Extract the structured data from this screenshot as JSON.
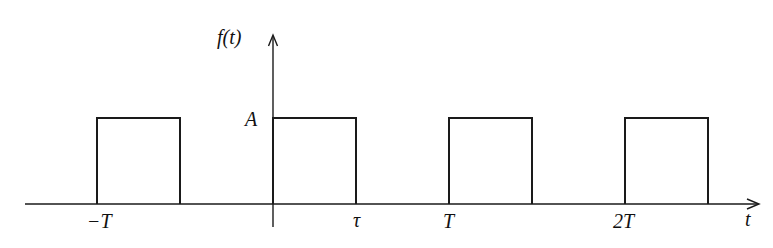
{
  "diagram": {
    "type": "periodic rectangular pulse train",
    "y_axis_label": "f(t)",
    "x_axis_label": "t",
    "amplitude_label": "A",
    "tick_labels": [
      "-T",
      "τ",
      "T",
      "2T"
    ],
    "tick_label_text": {
      "minus_T": "−T",
      "tau": "τ",
      "T": "T",
      "two_T": "2T"
    },
    "pulses": [
      {
        "start": "-T",
        "end": "-T+τ",
        "height": "A"
      },
      {
        "start": "0",
        "end": "τ",
        "height": "A"
      },
      {
        "start": "T",
        "end": "T+τ",
        "height": "A"
      },
      {
        "start": "2T",
        "end": "2T+τ",
        "height": "A"
      }
    ],
    "line_color": "#1a1a1a",
    "background": "#ffffff"
  }
}
